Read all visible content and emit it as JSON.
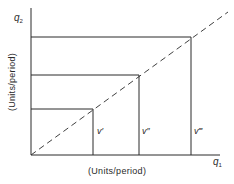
{
  "diagram": {
    "axes": {
      "x_symbol": "q",
      "x_subscript": "1",
      "y_symbol": "q",
      "y_subscript": "2",
      "x_units_label": "(Units/period)",
      "y_units_label": "(Units/period)"
    },
    "diagonal": {
      "style": "dashed",
      "description": "45-degree ray from origin"
    },
    "isoquant_corners": [
      {
        "label": "v′",
        "x_px": 93,
        "y_px": 109
      },
      {
        "label": "v″",
        "x_px": 139,
        "y_px": 75
      },
      {
        "label": "v‴",
        "x_px": 191,
        "y_px": 37
      }
    ],
    "colors": {
      "line": "#2a2a2a",
      "background": "#ffffff"
    }
  }
}
